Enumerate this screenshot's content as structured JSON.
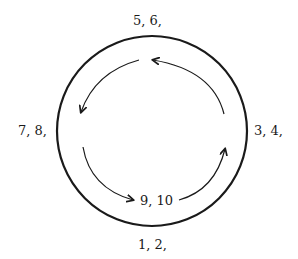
{
  "diagram": {
    "type": "cycle",
    "colors": {
      "stroke": "#1a1a1a",
      "background": "#ffffff"
    },
    "labels": {
      "top": "5, 6,",
      "left": "7, 8,",
      "right": "3, 4,",
      "bottom": "1, 2,",
      "center_bottom": "9, 10"
    },
    "arrows": [
      {
        "id": "right-to-top",
        "direction": "counter-clockwise"
      },
      {
        "id": "top-to-left",
        "direction": "counter-clockwise"
      },
      {
        "id": "left-to-bottom",
        "direction": "counter-clockwise"
      },
      {
        "id": "bottom-to-right",
        "direction": "counter-clockwise"
      }
    ]
  }
}
